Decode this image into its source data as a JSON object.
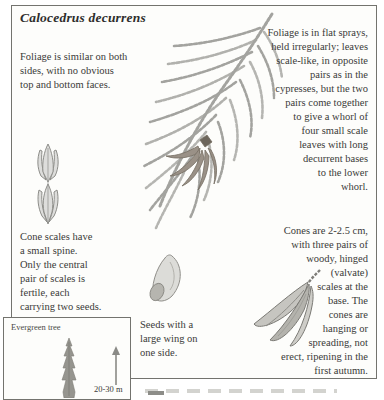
{
  "page": {
    "title": "Calocedrus decurrens"
  },
  "annotations": {
    "foliage_faces": [
      "Foliage is similar on both",
      "sides, with no obvious",
      "top and bottom faces."
    ],
    "foliage_sprays": [
      "Foliage is in flat sprays,",
      "held irregularly; leaves",
      "scale-like, in opposite",
      "pairs as in the",
      "cypresses, but the two",
      "pairs come together",
      "to give a whorl of",
      "four small scale",
      "leaves with long",
      "decurrent bases",
      "to the lower",
      "whorl."
    ],
    "cone_scales": [
      "Cone scales have",
      "a small spine.",
      "Only the central",
      "pair of scales is",
      "fertile, each",
      "carrying two seeds."
    ],
    "seeds": [
      "Seeds with a",
      "large wing on",
      "one side."
    ],
    "cones": [
      "Cones are 2-2.5 cm,",
      "with three pairs of",
      "woody, hinged",
      "(valvate)",
      "scales at the",
      "base. The",
      "cones are",
      "hanging or",
      "spreading, not",
      "erect, ripening in the",
      "first autumn."
    ]
  },
  "habit_box": {
    "label": "Evergreen tree",
    "height_range": "20-30 m"
  },
  "illustrations": {
    "spray": "foliage-spray-sketch",
    "shoot": "shoot-whorl-sketch",
    "seed": "winged-seed-sketch",
    "cone": "hanging-cone-sketch",
    "tree": "evergreen-tree-silhouette"
  },
  "colors": {
    "paper": "#fdfdfb",
    "text": "#3a3a38",
    "frame": "#73736e",
    "sketch": "#a3a39f"
  }
}
